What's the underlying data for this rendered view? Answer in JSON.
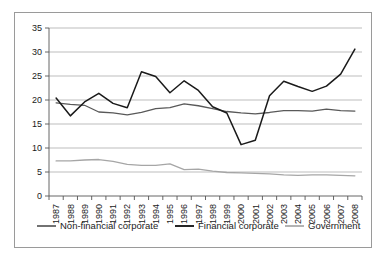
{
  "chart_data": {
    "type": "line",
    "title": "",
    "subtitle": "",
    "xlabel": "",
    "ylabel": "",
    "xlim": [
      1987,
      2008
    ],
    "ylim": [
      0,
      35
    ],
    "ytick_step": 5,
    "grid": true,
    "legend_position": "bottom",
    "x": [
      1987,
      1988,
      1989,
      1990,
      1991,
      1992,
      1993,
      1994,
      1995,
      1996,
      1997,
      1998,
      1999,
      2000,
      2001,
      2002,
      2003,
      2004,
      2005,
      2006,
      2007,
      2008
    ],
    "categories": [
      "1987",
      "1988",
      "1989",
      "1990",
      "1991",
      "1992",
      "1993",
      "1994",
      "1995",
      "1996",
      "1997",
      "1998",
      "1999",
      "2000",
      "2001",
      "2002",
      "2003",
      "2004",
      "2005",
      "2006",
      "2007",
      "2008"
    ],
    "yticks": [
      0,
      5,
      10,
      15,
      20,
      25,
      30,
      35
    ],
    "ytick_labels": [
      "0",
      "5",
      "10",
      "15",
      "20",
      "25",
      "30",
      "35"
    ],
    "series": [
      {
        "name": "Non-financial corporate",
        "color": "#595959",
        "width": 1.3,
        "values": [
          19.4,
          19.1,
          18.9,
          17.5,
          17.3,
          16.9,
          17.4,
          18.2,
          18.4,
          19.2,
          18.8,
          18.2,
          17.6,
          17.3,
          17.1,
          17.4,
          17.8,
          17.8,
          17.7,
          18.1,
          17.8,
          17.7
        ]
      },
      {
        "name": "Financial corporate",
        "color": "#1a1a1a",
        "width": 1.5,
        "values": [
          20.4,
          16.7,
          19.6,
          21.4,
          19.3,
          18.4,
          25.9,
          24.9,
          21.5,
          24.0,
          22.0,
          18.6,
          17.3,
          10.7,
          11.6,
          20.9,
          23.9,
          22.8,
          21.8,
          22.9,
          25.4,
          30.6
        ]
      },
      {
        "name": "Government",
        "color": "#a6a6a6",
        "width": 1.3,
        "values": [
          7.3,
          7.3,
          7.5,
          7.6,
          7.2,
          6.6,
          6.4,
          6.4,
          6.7,
          5.5,
          5.6,
          5.2,
          4.9,
          4.8,
          4.7,
          4.6,
          4.4,
          4.3,
          4.4,
          4.4,
          4.3,
          4.2
        ]
      }
    ]
  },
  "legend": {
    "items": [
      {
        "label": "Non-financial corporate"
      },
      {
        "label": "Financial corporate"
      },
      {
        "label": "Government"
      }
    ]
  }
}
